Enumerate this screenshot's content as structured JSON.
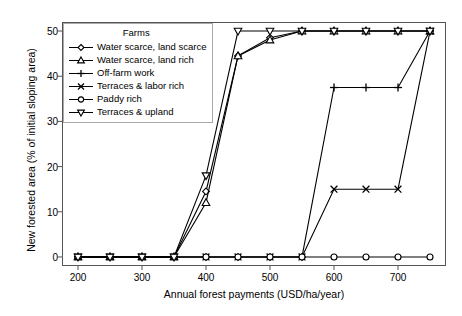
{
  "chart_data": {
    "type": "line",
    "title": "",
    "xlabel": "Annual forest payments (USD/ha/year)",
    "ylabel": "New forested area (% of initial sloping area)",
    "xlim": [
      175,
      775
    ],
    "ylim": [
      -2,
      52
    ],
    "xticks": [
      200,
      300,
      400,
      500,
      600,
      700
    ],
    "yticks": [
      0,
      10,
      20,
      30,
      40,
      50
    ],
    "grid": false,
    "legend_title": "Farms",
    "legend_position": "top-left inside",
    "x": [
      200,
      250,
      300,
      350,
      400,
      450,
      500,
      550,
      600,
      650,
      700,
      750
    ],
    "series": [
      {
        "name": "Water scarce, land scarce",
        "marker": "diamond",
        "values": [
          0,
          0,
          0,
          0,
          14.5,
          44.5,
          48.5,
          50,
          50,
          50,
          50,
          50
        ]
      },
      {
        "name": "Water scarce, land rich",
        "marker": "triangle-up",
        "values": [
          0,
          0,
          0,
          0,
          12.0,
          44.5,
          48.0,
          50,
          50,
          50,
          50,
          50
        ]
      },
      {
        "name": "Off-farm work",
        "marker": "plus",
        "values": [
          0,
          0,
          0,
          0,
          0,
          0,
          0,
          0,
          37.5,
          37.5,
          37.5,
          50
        ]
      },
      {
        "name": "Terraces & labor rich",
        "marker": "cross",
        "values": [
          0,
          0,
          0,
          0,
          0,
          0,
          0,
          0,
          15.0,
          15.0,
          15.0,
          50
        ]
      },
      {
        "name": "Paddy rich",
        "marker": "circle",
        "values": [
          0,
          0,
          0,
          0,
          0,
          0,
          0,
          0,
          0,
          0,
          0,
          0
        ]
      },
      {
        "name": "Terraces & upland",
        "marker": "triangle-down",
        "values": [
          0,
          0,
          0,
          0,
          18.0,
          50,
          50,
          50,
          50,
          50,
          50,
          50
        ]
      }
    ],
    "colors": {
      "line": "#000000",
      "marker_fill": "#ffffff",
      "frame": "#555555"
    }
  }
}
